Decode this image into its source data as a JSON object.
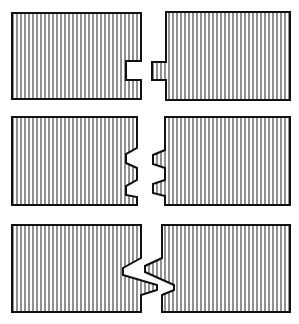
{
  "diagram": {
    "colors": {
      "stroke": "#111111",
      "hatch": "#222222",
      "background": "#ffffff"
    },
    "joints": [
      {
        "name": "tongue-and-groove",
        "row": 1
      },
      {
        "name": "double-dovetail-tongue",
        "row": 2
      },
      {
        "name": "interlocking-z-joint",
        "row": 3
      }
    ]
  }
}
